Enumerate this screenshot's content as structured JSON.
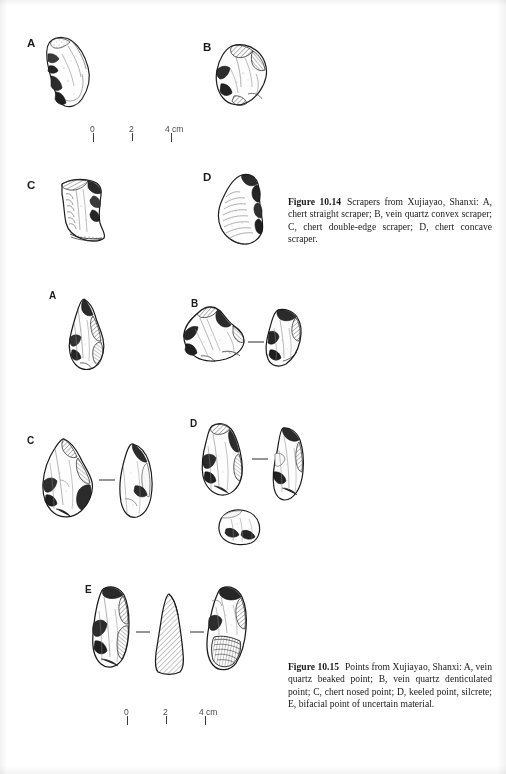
{
  "page": {
    "background": "#ffffff",
    "ink": "#1a1a1a"
  },
  "figures": [
    {
      "id": "figure-10-14",
      "number": "Figure 10.14",
      "caption_text": "Scrapers from Xujiayao, Shanxi: A, chert straight scraper; B, vein quartz convex scraper; C, chert double-edge scraper; D, chert concave scraper.",
      "specimens": [
        {
          "label": "A",
          "description": "chert straight scraper"
        },
        {
          "label": "B",
          "description": "vein quartz convex scraper"
        },
        {
          "label": "C",
          "description": "chert double-edge scraper"
        },
        {
          "label": "D",
          "description": "chert concave scraper"
        }
      ],
      "scale_bar": {
        "ticks": [
          "0",
          "2",
          "4"
        ],
        "unit": "cm",
        "end_label": "4 cm"
      }
    },
    {
      "id": "figure-10-15",
      "number": "Figure 10.15",
      "caption_text": "Points from Xujiayao, Shanxi: A, vein quartz beaked point; B, vein quartz denticulated point; C, chert nosed point; D, keeled point, silcrete; E, bifacial point of uncertain material.",
      "specimens": [
        {
          "label": "A",
          "description": "vein quartz beaked point"
        },
        {
          "label": "B",
          "description": "vein quartz denticulated point"
        },
        {
          "label": "C",
          "description": "chert nosed point"
        },
        {
          "label": "D",
          "description": "keeled point, silcrete"
        },
        {
          "label": "E",
          "description": "bifacial point of uncertain material"
        }
      ],
      "scale_bar": {
        "ticks": [
          "0",
          "2",
          "4"
        ],
        "unit": "cm",
        "end_label": "4 cm"
      }
    }
  ],
  "labels": {
    "f14_a": "A",
    "f14_b": "B",
    "f14_c": "C",
    "f14_d": "D",
    "f15_a": "A",
    "f15_b": "B",
    "f15_c": "C",
    "f15_d": "D",
    "f15_e": "E"
  },
  "scale_top": {
    "zero": "0",
    "two": "2",
    "four": "4 cm"
  },
  "scale_bottom": {
    "zero": "0",
    "two": "2",
    "four": "4 cm"
  }
}
